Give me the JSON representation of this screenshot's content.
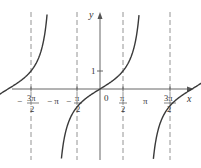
{
  "chart_data": {
    "type": "line",
    "title": "",
    "function": "y = tan x",
    "xlabel": "x",
    "ylabel": "y",
    "xlim": [
      -5.0,
      5.5
    ],
    "ylim": [
      -4.0,
      4.2
    ],
    "grid": false,
    "legend": null,
    "x_ticks": [
      {
        "value": -4.712,
        "label_num": "3π",
        "label_den": "2",
        "sign": "−"
      },
      {
        "value": -3.1416,
        "label": "−π"
      },
      {
        "value": -1.5708,
        "label_num": "π",
        "label_den": "2",
        "sign": "−"
      },
      {
        "value": 0,
        "label": "0"
      },
      {
        "value": 1.5708,
        "label_num": "π",
        "label_den": "2",
        "sign": ""
      },
      {
        "value": 3.1416,
        "label": "π"
      },
      {
        "value": 4.712,
        "label_num": "3π",
        "label_den": "2",
        "sign": ""
      }
    ],
    "y_ticks": [
      {
        "value": 1,
        "label": "1"
      }
    ],
    "asymptotes": [
      -4.712,
      -1.5708,
      1.5708,
      4.712
    ],
    "asymptote_style": "dashed",
    "series": [
      {
        "name": "branch 1",
        "x_range": [
          -4.62,
          -1.66
        ],
        "zero": -3.1416
      },
      {
        "name": "branch 2",
        "x_range": [
          -1.48,
          1.48
        ],
        "zero": 0
      },
      {
        "name": "branch 3",
        "x_range": [
          1.66,
          4.62
        ],
        "zero": 3.1416
      }
    ]
  },
  "labels": {
    "y_axis": "y",
    "x_axis": "x",
    "origin": "0",
    "y_one": "1",
    "neg_pi": "− π",
    "pi": "π",
    "neg_three_pi_half_sign": "−",
    "three_pi": "3π",
    "pi_sym": "π",
    "two": "2",
    "minus": "−"
  },
  "colors": {
    "curve": "#3a3a3a",
    "axis": "#555555",
    "asymptote": "#888888"
  }
}
